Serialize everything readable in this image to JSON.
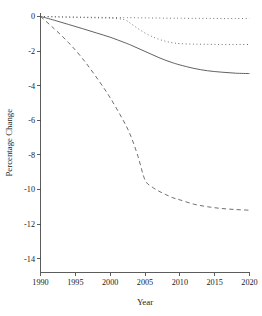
{
  "chart_data": {
    "type": "line",
    "title": "",
    "xlabel": "Year",
    "ylabel": "Percentage Change",
    "xlim": [
      1990,
      2020
    ],
    "ylim": [
      -14.8,
      0.2
    ],
    "grid": false,
    "legend": null,
    "x_ticks": [
      "1990",
      "1995",
      "2000",
      "2005",
      "2010",
      "2015",
      "2020"
    ],
    "x_tick_values": [
      1990,
      1995,
      2000,
      2005,
      2010,
      2015,
      2020
    ],
    "y_ticks": [
      "0",
      "-2",
      "-4",
      "-6",
      "-8",
      "-10",
      "-12",
      "-14"
    ],
    "y_tick_values": [
      0,
      -2,
      -4,
      -6,
      -8,
      -10,
      -12,
      -14
    ],
    "x": [
      1990,
      1992,
      1994,
      1996,
      1998,
      2000,
      2002,
      2003,
      2004,
      2005,
      2006,
      2007,
      2008,
      2009,
      2010,
      2012,
      2014,
      2016,
      2018,
      2020
    ],
    "series": [
      {
        "name": "series-flat-dotted",
        "style": "dotted",
        "color": "#555555",
        "values": [
          0.0,
          -0.02,
          -0.03,
          -0.04,
          -0.05,
          -0.06,
          -0.07,
          -0.07,
          -0.08,
          -0.08,
          -0.09,
          -0.09,
          -0.1,
          -0.1,
          -0.1,
          -0.11,
          -0.11,
          -0.12,
          -0.12,
          -0.12
        ]
      },
      {
        "name": "series-step-dotted",
        "style": "dotted",
        "color": "#555555",
        "values": [
          0.0,
          -0.02,
          -0.04,
          -0.06,
          -0.08,
          -0.1,
          -0.18,
          -0.42,
          -0.7,
          -0.96,
          -1.16,
          -1.32,
          -1.44,
          -1.52,
          -1.57,
          -1.6,
          -1.61,
          -1.62,
          -1.62,
          -1.62
        ]
      },
      {
        "name": "series-solid",
        "style": "solid",
        "color": "#444444",
        "values": [
          0.0,
          -0.22,
          -0.46,
          -0.7,
          -0.95,
          -1.2,
          -1.5,
          -1.66,
          -1.84,
          -2.02,
          -2.2,
          -2.38,
          -2.54,
          -2.68,
          -2.8,
          -3.0,
          -3.14,
          -3.22,
          -3.28,
          -3.3
        ]
      },
      {
        "name": "series-dashed",
        "style": "dashed",
        "color": "#555555",
        "values": [
          0.0,
          -0.72,
          -1.5,
          -2.42,
          -3.5,
          -4.7,
          -6.1,
          -6.95,
          -8.1,
          -9.45,
          -9.85,
          -10.1,
          -10.3,
          -10.48,
          -10.6,
          -10.85,
          -11.0,
          -11.1,
          -11.16,
          -11.2
        ]
      }
    ]
  }
}
